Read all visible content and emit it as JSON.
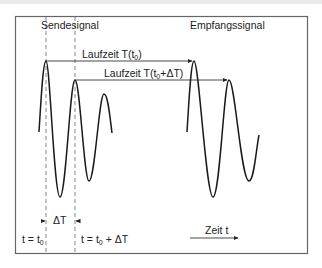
{
  "diagram": {
    "labels": {
      "send_signal": "Sendesignal",
      "receive_signal": "Empfangssignal",
      "runtime_1": {
        "text": "Laufzeit T(t",
        "sub": "0",
        "tail": ")"
      },
      "runtime_2": {
        "text": "Laufzeit T(t",
        "sub": "0",
        "tail": "+ΔT)"
      },
      "delta_t": "ΔT",
      "t_equals_t0": {
        "text": "t = t",
        "sub": "0",
        "tail": ""
      },
      "t_equals_t0_plus_dt": {
        "text": "t = t",
        "sub": "0",
        "tail": " + ΔT"
      },
      "time_axis": "Zeit t"
    },
    "colors": {
      "frame": "#555555",
      "wave": "#1a1a1a",
      "arrow": "#333333",
      "dashed": "#666666"
    }
  }
}
